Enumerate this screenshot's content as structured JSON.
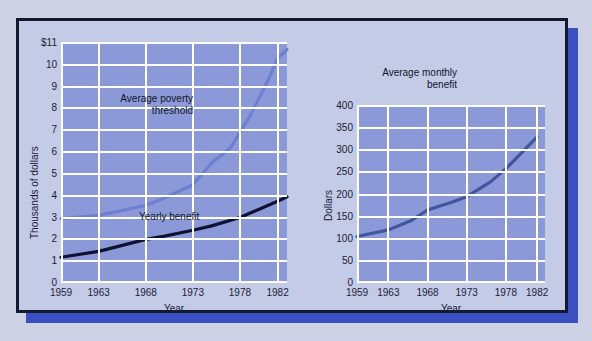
{
  "chart_data": [
    {
      "id": "poverty-vs-yearly-benefit",
      "type": "line",
      "title": "",
      "xlabel": "Year",
      "ylabel": "Thousands of dollars",
      "xlim": [
        1959,
        1983
      ],
      "ylim": [
        0,
        11
      ],
      "xticks": [
        "1959",
        "1963",
        "1968",
        "1973",
        "1978",
        "1982"
      ],
      "xtick_values": [
        1959,
        1963,
        1968,
        1973,
        1978,
        1982
      ],
      "yticks": [
        "0",
        "1",
        "2",
        "3",
        "4",
        "5",
        "6",
        "7",
        "8",
        "9",
        "10",
        "$11"
      ],
      "ytick_values": [
        0,
        1,
        2,
        3,
        4,
        5,
        6,
        7,
        8,
        9,
        10,
        11
      ],
      "grid": true,
      "legend": "annotations",
      "series": [
        {
          "name": "Average poverty threshold",
          "color": "#6d7fd2",
          "x": [
            1959,
            1963,
            1968,
            1970,
            1973,
            1975,
            1977,
            1979,
            1981,
            1982,
            1983
          ],
          "values": [
            2.95,
            3.1,
            3.55,
            3.9,
            4.5,
            5.5,
            6.2,
            7.6,
            9.3,
            10.3,
            10.7
          ]
        },
        {
          "name": "Yearly benefit",
          "color": "#0d1330",
          "x": [
            1959,
            1963,
            1968,
            1970,
            1973,
            1975,
            1978,
            1982,
            1983
          ],
          "values": [
            1.18,
            1.45,
            2.0,
            2.15,
            2.42,
            2.62,
            3.0,
            3.75,
            3.95
          ]
        }
      ]
    },
    {
      "id": "average-monthly-benefit",
      "type": "line",
      "title": "",
      "xlabel": "Year",
      "ylabel": "Dollars",
      "xlim": [
        1959,
        1983
      ],
      "ylim": [
        0,
        400
      ],
      "xticks": [
        "1959",
        "1963",
        "1968",
        "1973",
        "1978",
        "1982"
      ],
      "xtick_values": [
        1959,
        1963,
        1968,
        1973,
        1978,
        1982
      ],
      "yticks": [
        "0",
        "50",
        "100",
        "150",
        "200",
        "250",
        "300",
        "350",
        "400"
      ],
      "ytick_values": [
        0,
        50,
        100,
        150,
        200,
        250,
        300,
        350,
        400
      ],
      "grid": true,
      "legend": "annotations",
      "series": [
        {
          "name": "Average monthly benefit",
          "color": "#41569f",
          "x": [
            1959,
            1963,
            1966,
            1968,
            1971,
            1973,
            1976,
            1978,
            1982
          ],
          "values": [
            105,
            120,
            142,
            165,
            182,
            195,
            228,
            258,
            330
          ]
        }
      ]
    }
  ],
  "left_chart": {
    "yaxis_title": "Thousands of dollars",
    "xaxis_title": "Year",
    "annotation_poverty": "Average poverty\nthreshold",
    "annotation_yearly": "Yearly benefit"
  },
  "right_chart": {
    "yaxis_title": "Dollars",
    "xaxis_title": "Year",
    "annotation_monthly": "Average monthly\nbenefit"
  }
}
